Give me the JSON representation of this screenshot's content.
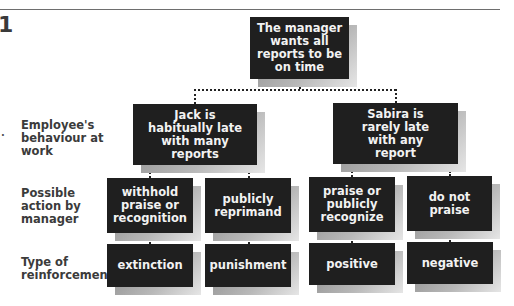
{
  "figure": {
    "number": "1",
    "marker": "."
  },
  "row_labels": {
    "behaviour": "Employee's behaviour at work",
    "action": "Possible action by manager",
    "reinforcement": "Type of reinforcement"
  },
  "root": {
    "text": "The manager wants all reports to be on time"
  },
  "employees": [
    {
      "behaviour": "Jack is habitually late with many reports",
      "actions": [
        {
          "action": "withhold praise or recognition",
          "reinforcement": "extinction"
        },
        {
          "action": "publicly reprimand",
          "reinforcement": "punishment"
        }
      ]
    },
    {
      "behaviour": "Sabira is rarely late with any report",
      "actions": [
        {
          "action": "praise or publicly recognize",
          "reinforcement": "positive"
        },
        {
          "action": "do not praise",
          "reinforcement": "negative"
        }
      ]
    }
  ],
  "colors": {
    "box_fill": "#1f1f1f",
    "box_text": "#f2f2f2",
    "label_text": "#3b3b3b",
    "connector": "#222222"
  }
}
